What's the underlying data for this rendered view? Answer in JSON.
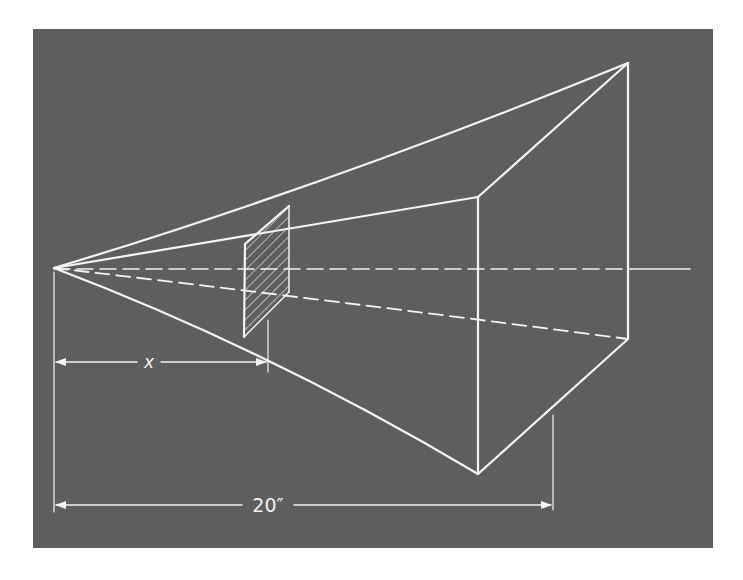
{
  "figure": {
    "background_color": "#5e5e5e",
    "line_color": "#f4f4f4",
    "labels": {
      "x_dimension": "x",
      "total_length": "20″"
    }
  }
}
